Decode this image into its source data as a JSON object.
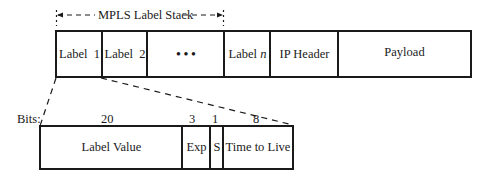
{
  "stack_label": {
    "text": "MPLS Label Stack"
  },
  "packet": {
    "cells": [
      {
        "label": "Label  1"
      },
      {
        "label": "Label  2"
      },
      {
        "label": "• • •"
      },
      {
        "label_prefix": "Label ",
        "label_var": "n"
      },
      {
        "label": "IP Header"
      },
      {
        "label": "Payload"
      }
    ]
  },
  "label_entry": {
    "bits_label": "Bits:",
    "fields": [
      {
        "label": "Label Value",
        "bits": "20"
      },
      {
        "label": "Exp",
        "bits": "3"
      },
      {
        "label": "S",
        "bits": "1"
      },
      {
        "label": "Time to Live",
        "bits": "8"
      }
    ]
  }
}
